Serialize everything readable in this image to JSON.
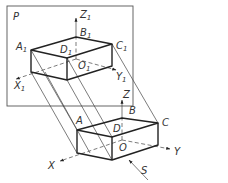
{
  "diagram": {
    "type": "oblique-parallel-projection",
    "plane_label": "P",
    "direction_label": "S",
    "projected_box": {
      "vertex_labels": [
        "A",
        "B",
        "C",
        "D",
        "O"
      ],
      "axis_labels": [
        "X",
        "Y",
        "Z"
      ]
    },
    "projection_box": {
      "vertex_labels": [
        "A",
        "B",
        "C",
        "D",
        "O"
      ],
      "axis_labels": [
        "X",
        "Y",
        "Z"
      ],
      "subscript": "1"
    }
  }
}
